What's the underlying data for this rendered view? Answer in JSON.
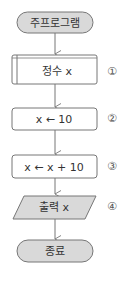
{
  "flowchart": {
    "nodes": [
      {
        "id": "start",
        "type": "terminal",
        "label": "주프로그램",
        "fill": "#d9d9d9"
      },
      {
        "id": "declare",
        "type": "predefined-process",
        "label": "정수 x",
        "number": "①",
        "fill": "#ffffff"
      },
      {
        "id": "assign1",
        "type": "process",
        "label": "x ← 10",
        "number": "②",
        "fill": "#ffffff"
      },
      {
        "id": "assign2",
        "type": "process",
        "label": "x ← x + 10",
        "number": "③",
        "fill": "#ffffff"
      },
      {
        "id": "output",
        "type": "io",
        "label": "출력 x",
        "number": "④",
        "fill": "#d9d9d9"
      },
      {
        "id": "end",
        "type": "terminal",
        "label": "종료",
        "fill": "#d9d9d9"
      }
    ],
    "edges": [
      [
        "start",
        "declare"
      ],
      [
        "declare",
        "assign1"
      ],
      [
        "assign1",
        "assign2"
      ],
      [
        "assign2",
        "output"
      ],
      [
        "output",
        "end"
      ]
    ]
  }
}
